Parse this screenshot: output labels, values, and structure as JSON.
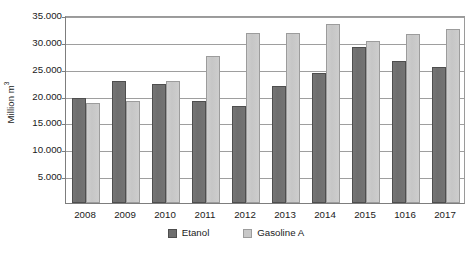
{
  "chart_data": {
    "type": "bar",
    "title": "",
    "xlabel": "",
    "ylabel": "Million m",
    "ylabel_sup": "3",
    "ylim": [
      0,
      35000
    ],
    "ytick_step": 5000,
    "ytick_labels": [
      "35.000",
      "30.000",
      "25.000",
      "20.000",
      "15.000",
      "10.000",
      "5.000"
    ],
    "ytick_values": [
      35000,
      30000,
      25000,
      20000,
      15000,
      10000,
      5000
    ],
    "grid": true,
    "legend_position": "bottom-center",
    "categories": [
      "2008",
      "2009",
      "2010",
      "2011",
      "2012",
      "2013",
      "2014",
      "2015",
      "1016",
      "2017"
    ],
    "series": [
      {
        "name": "Etanol",
        "color": "#6e6e6e",
        "values": [
          19500,
          22700,
          22100,
          19000,
          18000,
          21800,
          24300,
          29000,
          26400,
          25300
        ]
      },
      {
        "name": "Gasoline A",
        "color": "#c8c8c8",
        "values": [
          18700,
          19000,
          22800,
          27300,
          31700,
          31700,
          33400,
          30200,
          31500,
          32400
        ]
      }
    ]
  },
  "legend": {
    "items": [
      {
        "label": "Etanol"
      },
      {
        "label": "Gasoline A"
      }
    ]
  }
}
